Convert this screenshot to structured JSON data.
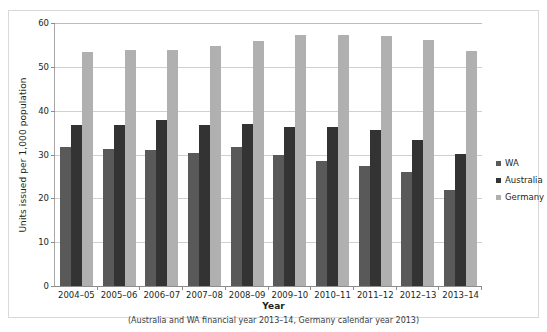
{
  "chart_data": {
    "type": "bar",
    "title": "",
    "xlabel": "Year",
    "xlabel_note": "(Australia and WA financial year 2013–14, Germany calendar year 2013)",
    "ylabel": "Units issued per 1,000 population",
    "ylim": [
      0,
      60
    ],
    "ytick_step": 10,
    "yticks": [
      "0",
      "10",
      "20",
      "30",
      "40",
      "50",
      "60"
    ],
    "grid": true,
    "legend_position": "right",
    "categories": [
      "2004–05",
      "2005–06",
      "2006–07",
      "2007–08",
      "2008–09",
      "2009–10",
      "2010–11",
      "2011–12",
      "2012–13",
      "2013–14"
    ],
    "series": [
      {
        "name": "WA",
        "color": "#595959",
        "values": [
          31.7,
          31.2,
          31.1,
          30.3,
          31.7,
          30.0,
          28.6,
          27.3,
          26.1,
          21.9
        ]
      },
      {
        "name": "Australia",
        "color": "#333333",
        "values": [
          36.7,
          36.8,
          37.8,
          36.7,
          36.9,
          36.3,
          36.2,
          35.7,
          33.4,
          30.2
        ]
      },
      {
        "name": "Germany",
        "color": "#b0b0b0",
        "values": [
          53.3,
          53.8,
          53.8,
          54.7,
          55.9,
          57.3,
          57.2,
          57.1,
          56.1,
          53.6
        ]
      }
    ]
  },
  "legend": {
    "items": [
      {
        "label": "WA",
        "key": "wa"
      },
      {
        "label": "Australia",
        "key": "au"
      },
      {
        "label": "Germany",
        "key": "de"
      }
    ]
  },
  "colors": {
    "wa": "#595959",
    "australia": "#333333",
    "germany": "#b0b0b0",
    "gridline": "#d0d0d0",
    "axis": "#8c8c8c",
    "frame": "#d9d9d9",
    "text": "#231f20"
  }
}
